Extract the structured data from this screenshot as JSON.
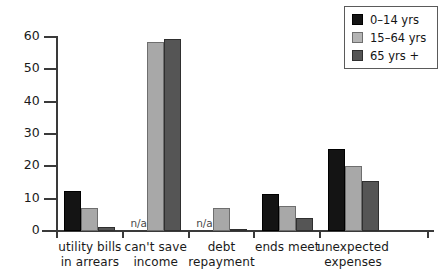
{
  "chart_data": {
    "type": "bar",
    "title": "",
    "subtitle": "",
    "xlabel": "",
    "ylabel": "",
    "ylim": [
      0,
      60
    ],
    "yticks": [
      0,
      10,
      20,
      30,
      40,
      50,
      60
    ],
    "ytick_labels": [
      "0",
      "10",
      "20",
      "30",
      "40",
      "50",
      "60"
    ],
    "grid": false,
    "legend_position": "top-right",
    "na_text": "n/a",
    "categories": [
      "utility bills\nin arrears",
      "can't save\nincome",
      "debt\nrepayment",
      "ends meet",
      "unexpected\nexpenses"
    ],
    "category_lines": [
      [
        "utility bills",
        "in arrears"
      ],
      [
        "can't save",
        "income"
      ],
      [
        "debt",
        "repayment"
      ],
      [
        "ends meet"
      ],
      [
        "unexpected",
        "expenses"
      ]
    ],
    "series": [
      {
        "name": "0–14 yrs",
        "color": "#141414",
        "values": [
          12.3,
          null,
          null,
          11.6,
          25.5
        ]
      },
      {
        "name": "15–64 yrs",
        "color": "#b4b4b4",
        "values": [
          7.0,
          58.5,
          7.2,
          7.7,
          20.0
        ]
      },
      {
        "name": "65 yrs +",
        "color": "#555555",
        "values": [
          1.2,
          59.5,
          0.7,
          4.1,
          15.5
        ]
      }
    ]
  },
  "legend": {
    "items": [
      {
        "label": "0–14 yrs"
      },
      {
        "label": "15–64 yrs"
      },
      {
        "label": "65 yrs +"
      }
    ]
  },
  "axis": {
    "y_labels": [
      "60",
      "50",
      "40",
      "30",
      "20",
      "10",
      "0"
    ]
  }
}
